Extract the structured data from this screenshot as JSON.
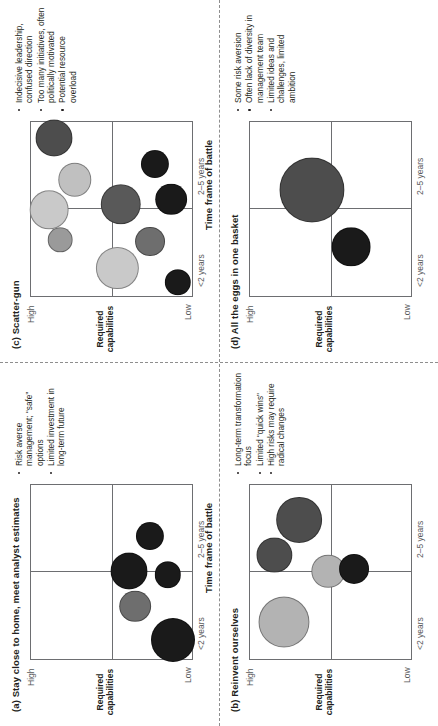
{
  "figure": {
    "axis_caption": "Time frame of battle",
    "y_axis_title": "Required capabilities",
    "y_high": "High",
    "y_low": "Low",
    "x_early": "<2 years",
    "x_late": "2–5 years"
  },
  "panels": [
    {
      "id": "a",
      "title": "(a) Stay close to home, meet analyst estimates",
      "bullets": [
        "Risk averse management; “safe” options",
        "Limited investment in long-term future"
      ]
    },
    {
      "id": "b",
      "title": "(b) Reinvent ourselves",
      "bullets": [
        "Long-term transformation focus",
        "Limited “quick wins”",
        "High risks may require radical changes"
      ]
    },
    {
      "id": "c",
      "title": "(c) Scatter-gun",
      "bullets": [
        "Indecisive leadership, confused direction",
        "Too many initiatives, often politically motivated",
        "Potential resource overload"
      ]
    },
    {
      "id": "d",
      "title": "(d) All the eggs in one basket",
      "bullets": [
        "Some risk aversion",
        "Often lack of diversity in management team",
        "Limited ideas and challenges, limited ambition"
      ]
    }
  ],
  "chart_data": {
    "type": "scatter",
    "xlabel": "Time frame of battle",
    "ylabel": "Required capabilities",
    "xticks": [
      "<2 years",
      "2–5 years"
    ],
    "yticks": [
      "High",
      "Low"
    ],
    "xlim": [
      0,
      100
    ],
    "ylim": [
      0,
      100
    ],
    "grid": "quadrant-cross",
    "legend": "none",
    "note": "Each panel is a bubble quadrant map. x = time frame (0 = immediate, 100 = 5 years); y = required capabilities (100 = High, 0 = Low); r = relative bubble radius in percent of plot width.",
    "colors": {
      "dark": "#1a1a1a",
      "mid_dark": "#4d4d4d",
      "mid": "#808080",
      "light": "#b3b3b3",
      "lighter": "#c9c9c9"
    },
    "panels": [
      {
        "id": "a",
        "title": "(a) Stay close to home, meet analyst estimates",
        "bubbles": [
          {
            "x": 11,
            "y": 13,
            "r": 12.5,
            "color": "#1a1a1a"
          },
          {
            "x": 30,
            "y": 36,
            "r": 9.0,
            "color": "#6e6e6e"
          },
          {
            "x": 50,
            "y": 40,
            "r": 10.5,
            "color": "#1a1a1a"
          },
          {
            "x": 48,
            "y": 16,
            "r": 7.5,
            "color": "#1a1a1a"
          },
          {
            "x": 70,
            "y": 27,
            "r": 8.0,
            "color": "#1a1a1a"
          }
        ]
      },
      {
        "id": "b",
        "title": "(b) Reinvent ourselves",
        "bubbles": [
          {
            "x": 21,
            "y": 79,
            "r": 14.5,
            "color": "#b3b3b3"
          },
          {
            "x": 59,
            "y": 85,
            "r": 10.0,
            "color": "#4d4d4d"
          },
          {
            "x": 79,
            "y": 70,
            "r": 13.0,
            "color": "#4d4d4d"
          },
          {
            "x": 50,
            "y": 52,
            "r": 9.5,
            "color": "#b3b3b3"
          },
          {
            "x": 51,
            "y": 36,
            "r": 8.5,
            "color": "#1a1a1a"
          }
        ]
      },
      {
        "id": "c",
        "title": "(c) Scatter-gun",
        "bubbles": [
          {
            "x": 8,
            "y": 10,
            "r": 7.5,
            "color": "#1a1a1a"
          },
          {
            "x": 31,
            "y": 27,
            "r": 8.5,
            "color": "#6e6e6e"
          },
          {
            "x": 16,
            "y": 47,
            "r": 12.0,
            "color": "#c9c9c9"
          },
          {
            "x": 52,
            "y": 45,
            "r": 11.5,
            "color": "#595959"
          },
          {
            "x": 55,
            "y": 14,
            "r": 9.0,
            "color": "#1a1a1a"
          },
          {
            "x": 75,
            "y": 24,
            "r": 8.0,
            "color": "#1a1a1a"
          },
          {
            "x": 32,
            "y": 82,
            "r": 7.0,
            "color": "#9a9a9a"
          },
          {
            "x": 49,
            "y": 89,
            "r": 11.0,
            "color": "#c9c9c9"
          },
          {
            "x": 66,
            "y": 73,
            "r": 9.5,
            "color": "#c0c0c0"
          },
          {
            "x": 90,
            "y": 86,
            "r": 10.5,
            "color": "#4d4d4d"
          }
        ]
      },
      {
        "id": "d",
        "title": "(d) All the eggs in one basket",
        "bubbles": [
          {
            "x": 28,
            "y": 38,
            "r": 11.0,
            "color": "#1a1a1a"
          },
          {
            "x": 60,
            "y": 62,
            "r": 18.5,
            "color": "#4d4d4d"
          }
        ]
      }
    ]
  }
}
